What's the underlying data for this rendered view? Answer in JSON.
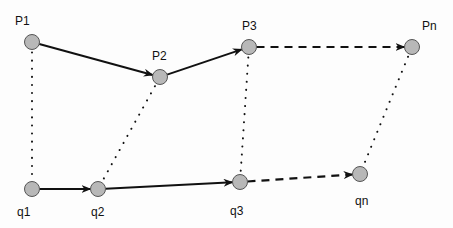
{
  "diagram": {
    "nodes": {
      "P1": {
        "label": "P1",
        "x": 32,
        "y": 42,
        "lx": 15,
        "ly": 25
      },
      "P2": {
        "label": "P2",
        "x": 160,
        "y": 77,
        "lx": 152,
        "ly": 60
      },
      "P3": {
        "label": "P3",
        "x": 249,
        "y": 47,
        "lx": 242,
        "ly": 30
      },
      "Pn": {
        "label": "Pn",
        "x": 412,
        "y": 47,
        "lx": 422,
        "ly": 30
      },
      "q1": {
        "label": "q1",
        "x": 32,
        "y": 189,
        "lx": 17,
        "ly": 216
      },
      "q2": {
        "label": "q2",
        "x": 98,
        "y": 189,
        "lx": 91,
        "ly": 216
      },
      "q3": {
        "label": "q3",
        "x": 240,
        "y": 182,
        "lx": 230,
        "ly": 215
      },
      "qn": {
        "label": "qn",
        "x": 360,
        "y": 174,
        "lx": 355,
        "ly": 205
      }
    },
    "node_fill": "#b8b8b8",
    "node_stroke": "#555555",
    "edges": {
      "solid": [
        [
          "P1",
          "P2"
        ],
        [
          "P2",
          "P3"
        ],
        [
          "q1",
          "q2"
        ],
        [
          "q2",
          "q3"
        ]
      ],
      "dashed": [
        [
          "P3",
          "Pn"
        ],
        [
          "q3",
          "qn"
        ]
      ],
      "dotted": [
        [
          "P1",
          "q1"
        ],
        [
          "P2",
          "q2"
        ],
        [
          "P3",
          "q3"
        ],
        [
          "Pn",
          "qn"
        ]
      ]
    }
  }
}
